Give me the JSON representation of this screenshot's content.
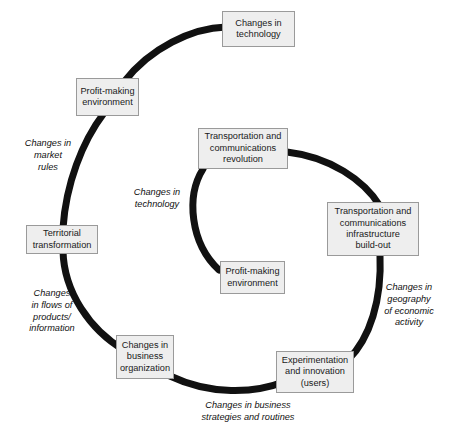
{
  "diagram": {
    "canvas": {
      "width": 450,
      "height": 437
    },
    "colors": {
      "background": "#ffffff",
      "arc": "#111111",
      "node_fill": "#eeeeee",
      "node_border": "#9a9a9a",
      "text": "#1a1a1a"
    },
    "outer_cycle": {
      "name": "outer-cycle",
      "nodes": [
        {
          "id": "changes-in-technology",
          "label": "Changes in\ntechnology",
          "x": 222,
          "y": 11,
          "w": 73,
          "h": 36
        },
        {
          "id": "profit-making-environment-outer",
          "label": "Profit-making\nenvironment",
          "x": 76,
          "y": 78,
          "w": 63,
          "h": 38
        },
        {
          "id": "territorial-transformation",
          "label": "Territorial\ntransformation",
          "x": 26,
          "y": 225,
          "w": 72,
          "h": 29
        },
        {
          "id": "changes-in-business-organization",
          "label": "Changes in\nbusiness\norganization",
          "x": 116,
          "y": 335,
          "w": 58,
          "h": 44
        }
      ],
      "edge_labels": [
        {
          "id": "changes-in-market-rules",
          "label": "Changes in\nmarket\nrules",
          "x": 14,
          "y": 138,
          "w": 68
        },
        {
          "id": "changes-in-flows",
          "label": "Changes\nin flows of\nproducts/\ninformation",
          "x": 16,
          "y": 288,
          "w": 72
        },
        {
          "id": "changes-in-business-strategies",
          "label": "Changes in business\nstrategies and routines",
          "x": 168,
          "y": 400,
          "w": 160
        }
      ]
    },
    "inner_cycle": {
      "name": "inner-cycle",
      "nodes": [
        {
          "id": "transportation-communications-revolution",
          "label": "Transportation and\ncommunications\nrevolution",
          "x": 198,
          "y": 128,
          "w": 90,
          "h": 41
        },
        {
          "id": "transportation-communications-infrastructure",
          "label": "Transportation and\ncommunications\ninfrastructure\nbuild-out",
          "x": 327,
          "y": 202,
          "w": 92,
          "h": 54
        },
        {
          "id": "experimentation-and-innovation",
          "label": "Experimentation\nand innovation\n(users)",
          "x": 276,
          "y": 351,
          "w": 78,
          "h": 42
        },
        {
          "id": "profit-making-environment-inner",
          "label": "Profit-making\nenvironment",
          "x": 220,
          "y": 261,
          "w": 65,
          "h": 33
        }
      ],
      "edge_labels": [
        {
          "id": "changes-in-technology-inner",
          "label": "Changes in\ntechnology",
          "x": 124,
          "y": 187,
          "w": 66
        },
        {
          "id": "changes-in-geography",
          "label": "Changes in\ngeography\nof economic\nactivity",
          "x": 374,
          "y": 282,
          "w": 70
        }
      ]
    }
  }
}
